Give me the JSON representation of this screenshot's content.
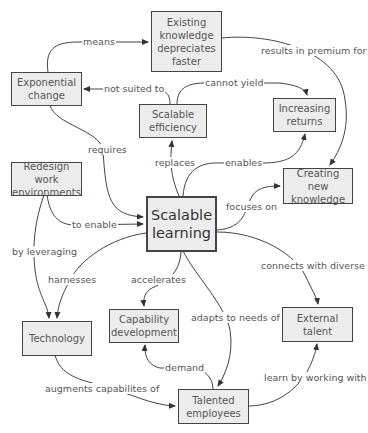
{
  "diagram": {
    "type": "concept-map",
    "nodes": [
      {
        "id": "existing",
        "label": "Existing\nknowledge\ndepreciates\nfaster"
      },
      {
        "id": "exponential",
        "label": "Exponential\nchange"
      },
      {
        "id": "efficiency",
        "label": "Scalable\nefficiency"
      },
      {
        "id": "returns",
        "label": "Increasing\nreturns"
      },
      {
        "id": "redesign",
        "label": "Redesign work\nenvironments"
      },
      {
        "id": "learning",
        "label": "Scalable\nlearning"
      },
      {
        "id": "creating",
        "label": "Creating new\nknowledge"
      },
      {
        "id": "technology",
        "label": "Technology"
      },
      {
        "id": "capability",
        "label": "Capability\ndevelopment"
      },
      {
        "id": "external",
        "label": "External\ntalent"
      },
      {
        "id": "talented",
        "label": "Talented\nemployees"
      }
    ],
    "edges": [
      {
        "from": "exponential",
        "to": "existing",
        "label": "means"
      },
      {
        "from": "existing",
        "to": "creating",
        "label": "results in premium for"
      },
      {
        "from": "efficiency",
        "to": "exponential",
        "label": "not suited to"
      },
      {
        "from": "efficiency",
        "to": "returns",
        "label": "cannot yield"
      },
      {
        "from": "exponential",
        "to": "learning",
        "label": "requires"
      },
      {
        "from": "learning",
        "to": "efficiency",
        "label": "replaces"
      },
      {
        "from": "learning",
        "to": "returns",
        "label": "enables"
      },
      {
        "from": "learning",
        "to": "creating",
        "label": "focuses on"
      },
      {
        "from": "redesign",
        "to": "learning",
        "label": "to enable"
      },
      {
        "from": "redesign",
        "to": "technology",
        "label": "by leveraging"
      },
      {
        "from": "learning",
        "to": "technology",
        "label": "harnesses"
      },
      {
        "from": "learning",
        "to": "capability",
        "label": "accelerates"
      },
      {
        "from": "learning",
        "to": "talented",
        "label": "adapts to needs of"
      },
      {
        "from": "learning",
        "to": "external",
        "label": "connects with diverse"
      },
      {
        "from": "talented",
        "to": "capability",
        "label": "demand"
      },
      {
        "from": "technology",
        "to": "talented",
        "label": "augments capabilites of"
      },
      {
        "from": "talented",
        "to": "external",
        "label": "learn by working with"
      }
    ]
  },
  "colors": {
    "node_fill": "#ececec",
    "node_border": "#444444",
    "edge": "#444444",
    "text": "#555555"
  }
}
